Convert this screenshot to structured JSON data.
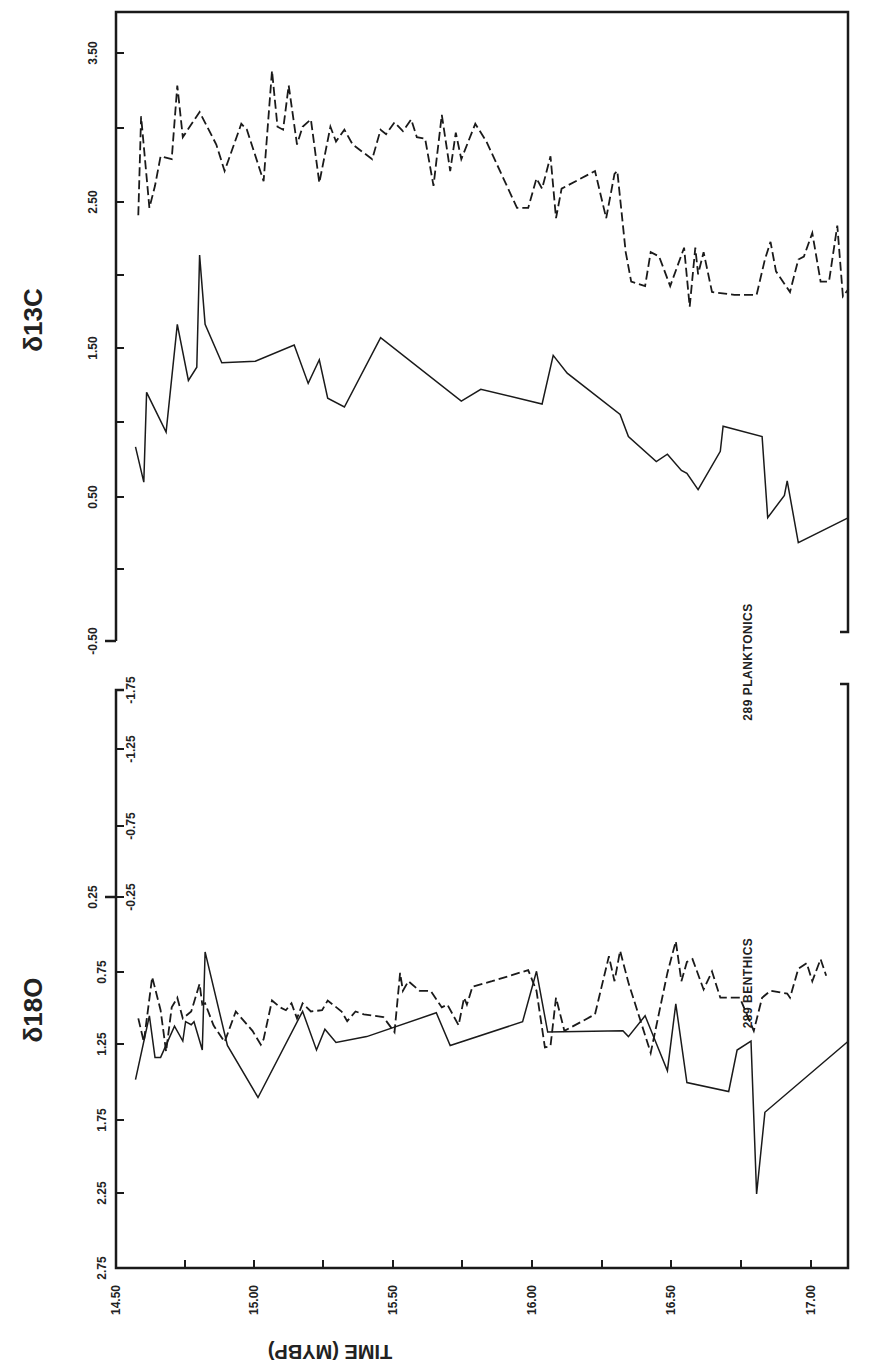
{
  "figure": {
    "x_axis_title": "TIME (MYBP)",
    "top_panel_title": "δ13C",
    "bottom_panel_title": "δ18O",
    "label_planktonics": "289  PLANKTONICS",
    "label_benthics": "289  BENTHICS"
  },
  "chart_data": [
    {
      "type": "line",
      "title": "δ13C",
      "xlabel": "TIME (MYBP)",
      "ylabel": "δ13C",
      "x_ticks": [
        "14.50",
        "15.00",
        "15.50",
        "16.00",
        "16.50",
        "17.00"
      ],
      "y_ticks": [
        "3.50",
        "2.50",
        "1.50",
        "0.50",
        "-0.50"
      ],
      "xlim": [
        14.5,
        17.13
      ],
      "ylim": [
        -0.5,
        3.9
      ],
      "grid": false,
      "series": [
        {
          "name": "289 Planktonics",
          "style": "dashed",
          "points": [
            [
              14.58,
              2.4
            ],
            [
              14.59,
              3.07
            ],
            [
              14.62,
              2.45
            ],
            [
              14.64,
              2.6
            ],
            [
              14.66,
              2.8
            ],
            [
              14.7,
              2.78
            ],
            [
              14.72,
              3.28
            ],
            [
              14.74,
              2.93
            ],
            [
              14.8,
              3.1
            ],
            [
              14.86,
              2.88
            ],
            [
              14.89,
              2.7
            ],
            [
              14.95,
              3.02
            ],
            [
              14.97,
              2.98
            ],
            [
              15.03,
              2.63
            ],
            [
              15.06,
              3.38
            ],
            [
              15.08,
              3.0
            ],
            [
              15.1,
              2.98
            ],
            [
              15.12,
              3.28
            ],
            [
              15.15,
              2.88
            ],
            [
              15.17,
              3.0
            ],
            [
              15.2,
              3.05
            ],
            [
              15.23,
              2.62
            ],
            [
              15.27,
              3.0
            ],
            [
              15.29,
              2.9
            ],
            [
              15.32,
              2.98
            ],
            [
              15.35,
              2.88
            ],
            [
              15.42,
              2.78
            ],
            [
              15.45,
              2.98
            ],
            [
              15.47,
              2.95
            ],
            [
              15.5,
              3.03
            ],
            [
              15.53,
              2.97
            ],
            [
              15.56,
              3.05
            ],
            [
              15.58,
              2.93
            ],
            [
              15.61,
              2.92
            ],
            [
              15.64,
              2.6
            ],
            [
              15.67,
              3.08
            ],
            [
              15.7,
              2.7
            ],
            [
              15.72,
              2.96
            ],
            [
              15.74,
              2.78
            ],
            [
              15.79,
              3.02
            ],
            [
              15.83,
              2.9
            ],
            [
              15.94,
              2.45
            ],
            [
              15.98,
              2.45
            ],
            [
              16.01,
              2.65
            ],
            [
              16.03,
              2.58
            ],
            [
              16.06,
              2.8
            ],
            [
              16.08,
              2.38
            ],
            [
              16.1,
              2.58
            ],
            [
              16.22,
              2.7
            ],
            [
              16.26,
              2.38
            ],
            [
              16.29,
              2.68
            ],
            [
              16.3,
              2.7
            ],
            [
              16.33,
              2.15
            ],
            [
              16.35,
              1.95
            ],
            [
              16.4,
              1.92
            ],
            [
              16.42,
              2.15
            ],
            [
              16.45,
              2.12
            ],
            [
              16.49,
              1.92
            ],
            [
              16.54,
              2.18
            ],
            [
              16.56,
              1.78
            ],
            [
              16.58,
              2.18
            ],
            [
              16.59,
              2.0
            ],
            [
              16.61,
              2.15
            ],
            [
              16.64,
              1.88
            ],
            [
              16.72,
              1.86
            ],
            [
              16.8,
              1.86
            ],
            [
              16.83,
              2.1
            ],
            [
              16.85,
              2.22
            ],
            [
              16.87,
              2.02
            ],
            [
              16.92,
              1.88
            ],
            [
              16.95,
              2.1
            ],
            [
              16.97,
              2.12
            ],
            [
              17.0,
              2.28
            ],
            [
              17.03,
              1.95
            ],
            [
              17.06,
              1.95
            ],
            [
              17.09,
              2.33
            ],
            [
              17.11,
              1.85
            ],
            [
              17.13,
              1.9
            ]
          ]
        },
        {
          "name": "289 Benthics",
          "style": "solid",
          "points": [
            [
              14.57,
              0.83
            ],
            [
              14.6,
              0.59
            ],
            [
              14.61,
              1.2
            ],
            [
              14.68,
              0.93
            ],
            [
              14.72,
              1.66
            ],
            [
              14.76,
              1.28
            ],
            [
              14.79,
              1.37
            ],
            [
              14.8,
              2.13
            ],
            [
              14.82,
              1.66
            ],
            [
              14.88,
              1.4
            ],
            [
              15.0,
              1.41
            ],
            [
              15.14,
              1.52
            ],
            [
              15.19,
              1.26
            ],
            [
              15.23,
              1.42
            ],
            [
              15.26,
              1.16
            ],
            [
              15.32,
              1.1
            ],
            [
              15.45,
              1.57
            ],
            [
              15.74,
              1.14
            ],
            [
              15.81,
              1.22
            ],
            [
              16.03,
              1.12
            ],
            [
              16.07,
              1.45
            ],
            [
              16.12,
              1.33
            ],
            [
              16.31,
              1.05
            ],
            [
              16.34,
              0.9
            ],
            [
              16.44,
              0.73
            ],
            [
              16.48,
              0.78
            ],
            [
              16.53,
              0.67
            ],
            [
              16.55,
              0.65
            ],
            [
              16.59,
              0.54
            ],
            [
              16.67,
              0.8
            ],
            [
              16.68,
              0.97
            ],
            [
              16.82,
              0.9
            ],
            [
              16.84,
              0.35
            ],
            [
              16.9,
              0.5
            ],
            [
              16.91,
              0.6
            ],
            [
              16.95,
              0.18
            ],
            [
              17.13,
              0.35
            ]
          ]
        }
      ]
    },
    {
      "type": "line",
      "title": "δ18O",
      "xlabel": "TIME (MYBP)",
      "ylabel": "δ18O",
      "x_ticks": [
        "14.50",
        "15.00",
        "15.50",
        "16.00",
        "16.50",
        "17.00"
      ],
      "y_ticks_benthic": [
        "0.25",
        "0.75",
        "1.25",
        "1.75",
        "2.25",
        "2.75"
      ],
      "y_ticks_planktonic": [
        "-1.75",
        "-1.25",
        "-0.75",
        "-0.25"
      ],
      "ylim_benthic": [
        2.75,
        0.25
      ],
      "ylim_planktonic": [
        -0.25,
        -1.75
      ],
      "grid": false,
      "series": [
        {
          "name": "289 Planktonics",
          "style": "dashed",
          "axis": "planktonic",
          "points": [
            [
              14.58,
              -1.13
            ],
            [
              14.6,
              -1.3
            ],
            [
              14.63,
              -0.83
            ],
            [
              14.66,
              -1.07
            ],
            [
              14.68,
              -1.37
            ],
            [
              14.7,
              -1.05
            ],
            [
              14.72,
              -0.98
            ],
            [
              14.74,
              -1.13
            ],
            [
              14.77,
              -1.08
            ],
            [
              14.8,
              -0.88
            ],
            [
              14.81,
              -1.03
            ],
            [
              14.82,
              -1.02
            ],
            [
              14.85,
              -1.18
            ],
            [
              14.89,
              -1.3
            ],
            [
              14.93,
              -1.08
            ],
            [
              14.99,
              -1.22
            ],
            [
              15.02,
              -1.32
            ],
            [
              15.03,
              -1.28
            ],
            [
              15.06,
              -1.0
            ],
            [
              15.09,
              -1.05
            ],
            [
              15.11,
              -1.07
            ],
            [
              15.13,
              -1.02
            ],
            [
              15.15,
              -1.13
            ],
            [
              15.17,
              -1.02
            ],
            [
              15.2,
              -1.08
            ],
            [
              15.24,
              -1.07
            ],
            [
              15.26,
              -1.0
            ],
            [
              15.31,
              -1.08
            ],
            [
              15.33,
              -1.15
            ],
            [
              15.36,
              -1.08
            ],
            [
              15.39,
              -1.1
            ],
            [
              15.46,
              -1.12
            ],
            [
              15.5,
              -1.23
            ],
            [
              15.52,
              -0.8
            ],
            [
              15.53,
              -0.93
            ],
            [
              15.55,
              -0.86
            ],
            [
              15.59,
              -0.93
            ],
            [
              15.63,
              -0.93
            ],
            [
              15.67,
              -1.05
            ],
            [
              15.69,
              -1.03
            ],
            [
              15.73,
              -1.18
            ],
            [
              15.75,
              -0.98
            ],
            [
              15.76,
              -1.03
            ],
            [
              15.78,
              -0.9
            ],
            [
              15.85,
              -0.86
            ],
            [
              15.98,
              -0.78
            ],
            [
              16.01,
              -0.93
            ],
            [
              16.04,
              -1.34
            ],
            [
              16.06,
              -1.33
            ],
            [
              16.08,
              -0.98
            ],
            [
              16.11,
              -1.22
            ],
            [
              16.22,
              -1.1
            ],
            [
              16.27,
              -0.68
            ],
            [
              16.29,
              -0.86
            ],
            [
              16.31,
              -0.64
            ],
            [
              16.34,
              -0.87
            ],
            [
              16.42,
              -1.38
            ],
            [
              16.48,
              -0.8
            ],
            [
              16.51,
              -0.57
            ],
            [
              16.53,
              -0.86
            ],
            [
              16.55,
              -0.72
            ],
            [
              16.57,
              -0.7
            ],
            [
              16.61,
              -0.92
            ],
            [
              16.64,
              -0.79
            ],
            [
              16.67,
              -0.98
            ],
            [
              16.74,
              -0.98
            ],
            [
              16.79,
              -1.22
            ],
            [
              16.82,
              -0.98
            ],
            [
              16.85,
              -0.93
            ],
            [
              16.91,
              -0.95
            ],
            [
              16.92,
              -0.98
            ],
            [
              16.95,
              -0.77
            ],
            [
              16.98,
              -0.73
            ],
            [
              17.0,
              -0.86
            ],
            [
              17.03,
              -0.7
            ],
            [
              17.05,
              -0.82
            ]
          ]
        },
        {
          "name": "289 Benthics",
          "style": "solid",
          "axis": "benthic",
          "points": [
            [
              14.57,
              1.48
            ],
            [
              14.62,
              1.05
            ],
            [
              14.64,
              1.33
            ],
            [
              14.66,
              1.33
            ],
            [
              14.71,
              1.12
            ],
            [
              14.74,
              1.22
            ],
            [
              14.75,
              1.09
            ],
            [
              14.77,
              1.11
            ],
            [
              14.78,
              1.09
            ],
            [
              14.81,
              1.28
            ],
            [
              14.82,
              0.62
            ],
            [
              14.9,
              1.25
            ],
            [
              15.01,
              1.6
            ],
            [
              15.17,
              1.02
            ],
            [
              15.22,
              1.28
            ],
            [
              15.25,
              1.14
            ],
            [
              15.29,
              1.23
            ],
            [
              15.4,
              1.19
            ],
            [
              15.65,
              1.03
            ],
            [
              15.7,
              1.25
            ],
            [
              15.96,
              1.09
            ],
            [
              16.01,
              0.75
            ],
            [
              16.05,
              1.16
            ],
            [
              16.32,
              1.15
            ],
            [
              16.34,
              1.19
            ],
            [
              16.4,
              1.05
            ],
            [
              16.48,
              1.42
            ],
            [
              16.51,
              0.97
            ],
            [
              16.55,
              1.5
            ],
            [
              16.7,
              1.56
            ],
            [
              16.73,
              1.28
            ],
            [
              16.78,
              1.22
            ],
            [
              16.8,
              2.25
            ],
            [
              16.83,
              1.7
            ],
            [
              17.13,
              1.22
            ]
          ]
        }
      ]
    }
  ]
}
